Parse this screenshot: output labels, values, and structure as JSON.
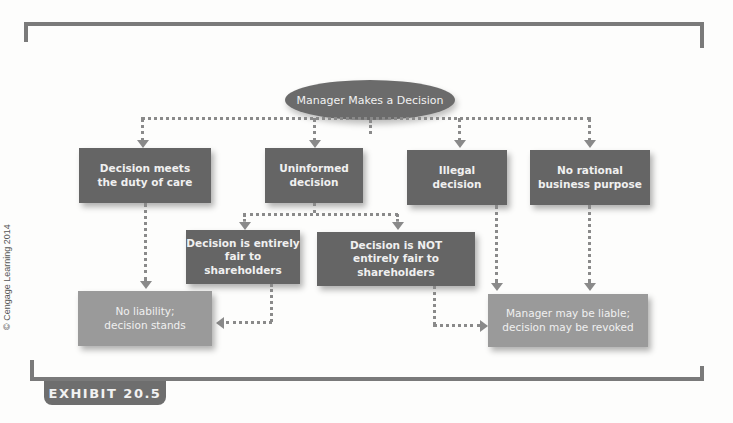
{
  "diagram": {
    "root": "Manager Makes a Decision",
    "level1": [
      "Decision meets\nthe duty of care",
      "Uninformed\ndecision",
      "Illegal\ndecision",
      "No rational\nbusiness purpose"
    ],
    "level2": [
      "Decision is entirely\nfair to shareholders",
      "Decision is NOT\nentirely fair to shareholders"
    ],
    "outcomes": [
      "No liability;\ndecision stands",
      "Manager may be liable;\ndecision may be revoked"
    ]
  },
  "exhibit_label": "EXHIBIT 20.5",
  "copyright": "© Cengage Learning 2014",
  "colors": {
    "dark_box": "#656565",
    "light_box": "#9a9a9a",
    "connector": "#8a8a8a"
  }
}
